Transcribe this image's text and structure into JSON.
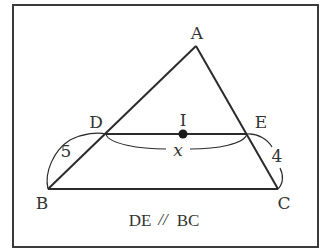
{
  "diagram": {
    "type": "triangle-with-parallel-segment",
    "colors": {
      "stroke": "#2b2b2b",
      "text": "#333333",
      "background": "#ffffff",
      "frame": "#3a3a3a"
    },
    "vertices": {
      "A": {
        "label": "A",
        "x": 196,
        "y": 46
      },
      "B": {
        "label": "B",
        "x": 48,
        "y": 189
      },
      "C": {
        "label": "C",
        "x": 278,
        "y": 189
      },
      "D": {
        "label": "D",
        "x": 106,
        "y": 134
      },
      "E": {
        "label": "E",
        "x": 247,
        "y": 134
      },
      "I": {
        "label": "I",
        "x": 183,
        "y": 134
      }
    },
    "measurements": {
      "BD": "5",
      "EC": "4",
      "DE": "x"
    },
    "caption": "DE",
    "caption_parallel_symbol": "//",
    "caption_right": "BC"
  }
}
